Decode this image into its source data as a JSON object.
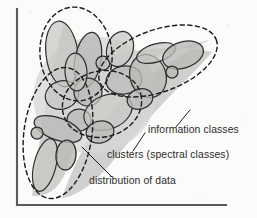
{
  "figure": {
    "type": "conceptual-scatter-diagram",
    "background_color": "#fbfbfa",
    "axis_color": "#5a5a5a",
    "cluster_fill_color": "#b9b9b7",
    "cluster_stroke_color": "#2e2e2e",
    "boundary_stroke_color": "#1f1f1f",
    "data_cloud_color": "#c9c9c7",
    "text_color": "#2b2b2b"
  },
  "axes": {
    "y_axis_name": "vertical-axis",
    "x_axis_name": "horizontal-axis",
    "y_axis": {
      "x": 17,
      "y_top": 9,
      "y_bottom": 205
    },
    "x_axis": {
      "y": 205,
      "x_left": 17,
      "x_right": 226
    }
  },
  "annotations": [
    {
      "id": "information-classes",
      "label": "information classes",
      "text_x": 148,
      "text_y": 133,
      "leader": "M 176 127 L 190 110"
    },
    {
      "id": "clusters-spectral-classes",
      "label": "clusters (spectral classes)",
      "text_x": 107,
      "text_y": 158,
      "leader": "M 133 151 L 145 133"
    },
    {
      "id": "distribution-of-data",
      "label": "distribution of data",
      "text_x": 89,
      "text_y": 184,
      "leader": "M 112 177 L 82 147"
    }
  ],
  "data_cloud": {
    "name": "distribution-of-data-region",
    "paths": [
      "M 64 24 C 52 66, 40 132, 32 196 C 44 197, 56 192, 64 176 C 74 150, 84 118, 96 96 C 112 76, 140 62, 168 52 C 186 46, 200 42, 210 40 C 196 46, 176 58, 156 72 C 130 90, 108 110, 92 134 C 78 156, 68 180, 62 198 C 78 196, 96 182, 112 162 C 132 138, 152 114, 172 94 C 190 76, 204 62, 212 52 C 196 48, 170 46, 144 50 C 116 54, 92 62, 78 44 C 72 36, 68 28, 64 24 Z"
    ]
  },
  "information_class_boundaries": [
    {
      "name": "boundary-upper-left",
      "cx": 76,
      "cy": 54,
      "rx": 36,
      "ry": 47,
      "rotation": -6
    },
    {
      "name": "boundary-right-arm",
      "cx": 158,
      "cy": 61,
      "rx": 62,
      "ry": 31,
      "rotation": -20
    },
    {
      "name": "boundary-lower-left",
      "cx": 58,
      "cy": 133,
      "rx": 34,
      "ry": 66,
      "rotation": 8
    },
    {
      "name": "boundary-center",
      "cx": 102,
      "cy": 104,
      "rx": 40,
      "ry": 33,
      "rotation": -14
    }
  ],
  "clusters": [
    {
      "name": "cluster-01",
      "cx": 62,
      "cy": 54,
      "rx": 16,
      "ry": 33,
      "rotation": -7
    },
    {
      "name": "cluster-02",
      "cx": 88,
      "cy": 60,
      "rx": 13,
      "ry": 28,
      "rotation": 10
    },
    {
      "name": "cluster-03",
      "cx": 103,
      "cy": 63,
      "rx": 7,
      "ry": 7,
      "rotation": 0
    },
    {
      "name": "cluster-04",
      "cx": 62,
      "cy": 95,
      "rx": 17,
      "ry": 14,
      "rotation": -20
    },
    {
      "name": "cluster-05",
      "cx": 88,
      "cy": 92,
      "rx": 14,
      "ry": 14,
      "rotation": 0
    },
    {
      "name": "cluster-06",
      "cx": 79,
      "cy": 120,
      "rx": 12,
      "ry": 11,
      "rotation": 0
    },
    {
      "name": "cluster-07",
      "cx": 108,
      "cy": 112,
      "rx": 25,
      "ry": 17,
      "rotation": -22
    },
    {
      "name": "cluster-08",
      "cx": 124,
      "cy": 80,
      "rx": 18,
      "ry": 14,
      "rotation": -12
    },
    {
      "name": "cluster-09",
      "cx": 148,
      "cy": 76,
      "rx": 18,
      "ry": 22,
      "rotation": -18
    },
    {
      "name": "cluster-10",
      "cx": 156,
      "cy": 53,
      "rx": 20,
      "ry": 9,
      "rotation": -17
    },
    {
      "name": "cluster-11",
      "cx": 183,
      "cy": 55,
      "rx": 21,
      "ry": 13,
      "rotation": -18
    },
    {
      "name": "cluster-12",
      "cx": 172,
      "cy": 72,
      "rx": 6,
      "ry": 6,
      "rotation": 0
    },
    {
      "name": "cluster-13",
      "cx": 120,
      "cy": 49,
      "rx": 13,
      "ry": 18,
      "rotation": 18
    },
    {
      "name": "cluster-14",
      "cx": 58,
      "cy": 129,
      "rx": 25,
      "ry": 11,
      "rotation": 20
    },
    {
      "name": "cluster-15",
      "cx": 37,
      "cy": 133,
      "rx": 6,
      "ry": 6,
      "rotation": 0
    },
    {
      "name": "cluster-16",
      "cx": 45,
      "cy": 165,
      "rx": 11,
      "ry": 27,
      "rotation": 14
    },
    {
      "name": "cluster-17",
      "cx": 66,
      "cy": 155,
      "rx": 10,
      "ry": 15,
      "rotation": 6
    },
    {
      "name": "cluster-18",
      "cx": 100,
      "cy": 132,
      "rx": 14,
      "ry": 11,
      "rotation": -14
    },
    {
      "name": "cluster-19",
      "cx": 76,
      "cy": 72,
      "rx": 11,
      "ry": 19,
      "rotation": -4
    },
    {
      "name": "cluster-20",
      "cx": 140,
      "cy": 99,
      "rx": 13,
      "ry": 10,
      "rotation": -16
    }
  ]
}
